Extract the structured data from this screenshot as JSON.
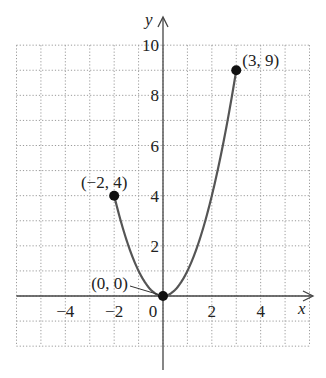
{
  "chart_data": {
    "type": "line",
    "title": "",
    "xlabel": "x",
    "ylabel": "y",
    "xlim": [
      -6,
      6
    ],
    "ylim": [
      -2,
      10
    ],
    "grid": true,
    "grid_style": "dotted",
    "function": "y = x^2",
    "domain": [
      -2,
      3
    ],
    "x_ticks": [
      -4,
      -2,
      0,
      2,
      4
    ],
    "x_tick_labels": [
      "−4",
      "−2",
      "0",
      "2",
      "4"
    ],
    "y_ticks": [
      2,
      4,
      6,
      8,
      10
    ],
    "y_tick_labels": [
      "2",
      "4",
      "6",
      "8",
      "10"
    ],
    "series": [
      {
        "name": "y = x^2",
        "x": [
          -2,
          -1.5,
          -1,
          -0.5,
          0,
          0.5,
          1,
          1.5,
          2,
          2.5,
          3
        ],
        "y": [
          4,
          2.25,
          1,
          0.25,
          0,
          0.25,
          1,
          2.25,
          4,
          6.25,
          9
        ]
      }
    ],
    "points": [
      {
        "x": -2,
        "y": 4,
        "label": "(−2, 4)"
      },
      {
        "x": 0,
        "y": 0,
        "label": "(0, 0)"
      },
      {
        "x": 3,
        "y": 9,
        "label": "(3, 9)"
      }
    ],
    "colors": {
      "curve": "#555555",
      "axis": "#444444",
      "grid": "#9a9a9a",
      "point": "#111111"
    }
  }
}
